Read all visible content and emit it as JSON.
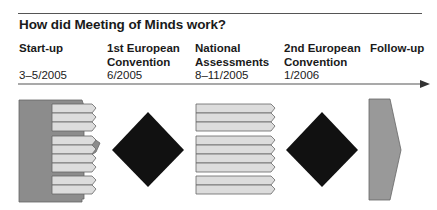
{
  "title": "How did Meeting of Minds work?",
  "phases": [
    {
      "name": "Start-up",
      "date": "3–5/2005"
    },
    {
      "name": "1st European\nConvention",
      "date": "6/2005"
    },
    {
      "name": "National\nAssessments",
      "date": "8–11/2005"
    },
    {
      "name": "2nd European\nConvention",
      "date": "1/2006"
    },
    {
      "name": "Follow-up",
      "date": ""
    }
  ],
  "colors": {
    "dark_gray": "#8c8c8c",
    "light_gray": "#dcdcdc",
    "black": "#111111",
    "line": "#555555"
  },
  "diagram": {
    "start_up_stripes": [
      3,
      4,
      2
    ],
    "national_assessment_stripes": [
      3,
      4,
      2
    ]
  }
}
